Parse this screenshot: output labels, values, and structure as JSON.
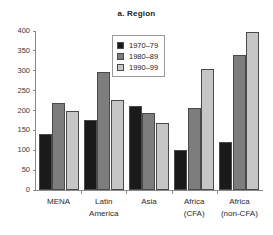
{
  "chart_data": {
    "type": "bar",
    "title": "a. Region",
    "xlabel": "",
    "ylabel": "",
    "ylim": [
      0,
      400
    ],
    "yticks": [
      0,
      50,
      100,
      150,
      200,
      250,
      300,
      350,
      400
    ],
    "grid": false,
    "legend_position": "top-center",
    "categories": [
      "MENA",
      "Latin America",
      "Asia",
      "Africa (CFA)",
      "Africa (non-CFA)"
    ],
    "category_lines": [
      [
        "MENA"
      ],
      [
        "Latin",
        "America"
      ],
      [
        "Asia"
      ],
      [
        "Africa",
        "(CFA)"
      ],
      [
        "Africa",
        "(non-CFA)"
      ]
    ],
    "series": [
      {
        "name": "1970–79",
        "color": "#1a1a1a",
        "values": [
          140,
          175,
          211,
          100,
          122
        ]
      },
      {
        "name": "1980–89",
        "color": "#7d7d7d",
        "values": [
          220,
          298,
          194,
          207,
          340
        ]
      },
      {
        "name": "1990–99",
        "color": "#c6c6c6",
        "values": [
          200,
          227,
          168,
          305,
          398
        ]
      }
    ]
  }
}
